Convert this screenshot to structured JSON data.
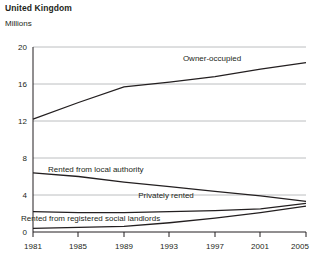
{
  "header": {
    "title": "United Kingdom",
    "subtitle": "Millions"
  },
  "chart_data": {
    "type": "line",
    "title": "United Kingdom",
    "subtitle": "Millions",
    "xlabel": "",
    "ylabel": "Millions",
    "ylim": [
      0,
      20
    ],
    "yticks": [
      0,
      4,
      8,
      12,
      16,
      20
    ],
    "xlim": [
      1981,
      2005
    ],
    "xticks": [
      1981,
      1985,
      1989,
      1993,
      1997,
      2001,
      2005
    ],
    "xtick_labels": [
      "1981",
      "1985",
      "1989",
      "1993",
      "1997",
      "2001",
      "2005"
    ],
    "ytick_labels": [
      "0",
      "4",
      "8",
      "12",
      "16",
      "20"
    ],
    "grid": true,
    "legend": "inline-labels",
    "x": [
      1981,
      1985,
      1989,
      1993,
      1997,
      2001,
      2005
    ],
    "series": [
      {
        "name": "Owner-occupied",
        "label": "Owner-occupied",
        "color": "#231f20",
        "values": [
          12.2,
          14.0,
          15.7,
          16.2,
          16.8,
          17.6,
          18.3
        ]
      },
      {
        "name": "Rented from local authority",
        "label": "Rented from local authority",
        "color": "#231f20",
        "values": [
          6.4,
          6.0,
          5.4,
          4.9,
          4.4,
          3.9,
          3.3
        ]
      },
      {
        "name": "Privately rented",
        "label": "Privately rented",
        "color": "#231f20",
        "values": [
          2.2,
          2.1,
          2.1,
          2.2,
          2.3,
          2.5,
          3.1
        ]
      },
      {
        "name": "Rented from registered social landlords",
        "label": "Rented from registered social landlords",
        "color": "#231f20",
        "values": [
          0.4,
          0.5,
          0.6,
          1.0,
          1.5,
          2.1,
          2.8
        ]
      }
    ],
    "annotations": [
      {
        "text": "Owner-occupied",
        "x": 1991.0,
        "y": 18.2
      },
      {
        "text": "Rented from local authority",
        "x": 1986.5,
        "y": 7.4
      },
      {
        "text": "Privately rented",
        "x": 1996.5,
        "y": 4.0
      },
      {
        "text": "Rented from registered social landlords",
        "x": 1987.0,
        "y": 2.2
      }
    ]
  }
}
